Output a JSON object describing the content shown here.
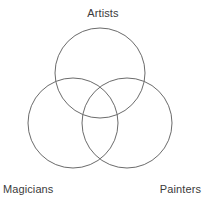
{
  "figure": {
    "type": "venn-diagram",
    "width": 206,
    "height": 209,
    "background_color": "#ffffff",
    "stroke_color": "#6b6b6b",
    "stroke_width": 1,
    "label_color": "#3b3b3b"
  },
  "labels": {
    "top": "Artists",
    "bottom_left": "Magicians",
    "bottom_right": "Painters"
  },
  "chart_data": {
    "type": "venn",
    "title": "",
    "subtitle": "",
    "xlabel": "",
    "ylabel": "",
    "grid": false,
    "legend": false,
    "set_count": 3,
    "sets": [
      {
        "name": "Artists",
        "label": "Artists",
        "label_position": "top-center",
        "center": [
          100,
          73
        ],
        "radius": 45,
        "fill": "none",
        "stroke": "#6b6b6b"
      },
      {
        "name": "Magicians",
        "label": "Magicians",
        "label_position": "bottom-left",
        "center": [
          73,
          123
        ],
        "radius": 45,
        "fill": "none",
        "stroke": "#6b6b6b"
      },
      {
        "name": "Painters",
        "label": "Painters",
        "label_position": "bottom-right",
        "center": [
          127,
          123
        ],
        "radius": 45,
        "fill": "none",
        "stroke": "#6b6b6b"
      }
    ],
    "regions": [
      {
        "sets": [
          "Artists"
        ],
        "count_label": ""
      },
      {
        "sets": [
          "Magicians"
        ],
        "count_label": ""
      },
      {
        "sets": [
          "Painters"
        ],
        "count_label": ""
      },
      {
        "sets": [
          "Artists",
          "Magicians"
        ],
        "count_label": ""
      },
      {
        "sets": [
          "Artists",
          "Painters"
        ],
        "count_label": ""
      },
      {
        "sets": [
          "Magicians",
          "Painters"
        ],
        "count_label": ""
      },
      {
        "sets": [
          "Artists",
          "Magicians",
          "Painters"
        ],
        "count_label": ""
      }
    ],
    "annotations": []
  }
}
